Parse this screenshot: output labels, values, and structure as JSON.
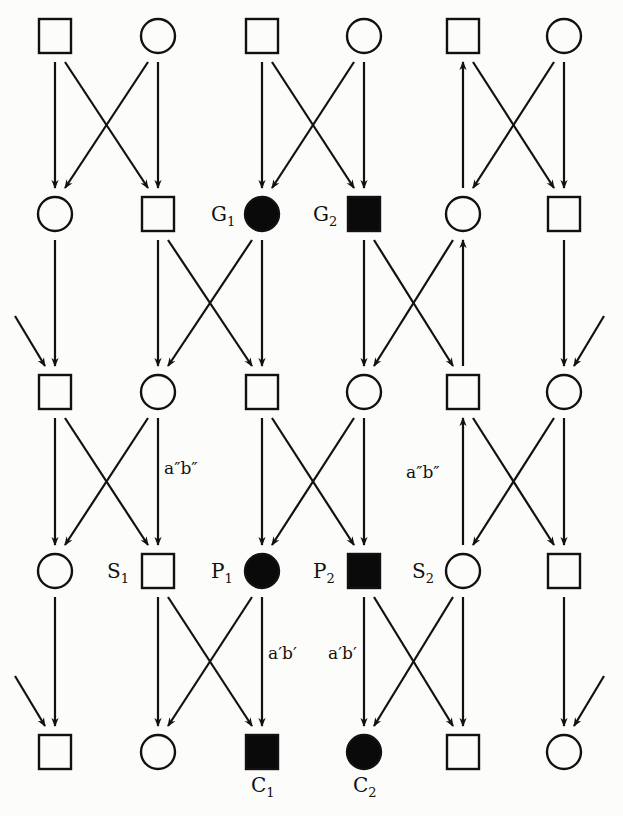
{
  "diagram": {
    "type": "pedigree",
    "columns_x": [
      55,
      158,
      262,
      364,
      463,
      564
    ],
    "rows_y": [
      36,
      214,
      392,
      571,
      752
    ],
    "colors": {
      "line": "#111111",
      "affected_fill": "#0a0a0a",
      "unaffected_fill": "#fcfcfa",
      "background": "#fcfcfa"
    },
    "nodes": [
      {
        "id": "r1c1",
        "row": 0,
        "col": 0,
        "shape": "square",
        "affected": false
      },
      {
        "id": "r1c2",
        "row": 0,
        "col": 1,
        "shape": "circle",
        "affected": false
      },
      {
        "id": "r1c3",
        "row": 0,
        "col": 2,
        "shape": "square",
        "affected": false
      },
      {
        "id": "r1c4",
        "row": 0,
        "col": 3,
        "shape": "circle",
        "affected": false
      },
      {
        "id": "r1c5",
        "row": 0,
        "col": 4,
        "shape": "square",
        "affected": false
      },
      {
        "id": "r1c6",
        "row": 0,
        "col": 5,
        "shape": "circle",
        "affected": false
      },
      {
        "id": "r2c1",
        "row": 1,
        "col": 0,
        "shape": "circle",
        "affected": false
      },
      {
        "id": "r2c2",
        "row": 1,
        "col": 1,
        "shape": "square",
        "affected": false
      },
      {
        "id": "G1",
        "row": 1,
        "col": 2,
        "shape": "circle",
        "affected": true,
        "label": "G",
        "sub": "1"
      },
      {
        "id": "G2",
        "row": 1,
        "col": 3,
        "shape": "square",
        "affected": true,
        "label": "G",
        "sub": "2"
      },
      {
        "id": "r2c5",
        "row": 1,
        "col": 4,
        "shape": "circle",
        "affected": false
      },
      {
        "id": "r2c6",
        "row": 1,
        "col": 5,
        "shape": "square",
        "affected": false
      },
      {
        "id": "r3c1",
        "row": 2,
        "col": 0,
        "shape": "square",
        "affected": false
      },
      {
        "id": "r3c2",
        "row": 2,
        "col": 1,
        "shape": "circle",
        "affected": false
      },
      {
        "id": "r3c3",
        "row": 2,
        "col": 2,
        "shape": "square",
        "affected": false
      },
      {
        "id": "r3c4",
        "row": 2,
        "col": 3,
        "shape": "circle",
        "affected": false
      },
      {
        "id": "r3c5",
        "row": 2,
        "col": 4,
        "shape": "square",
        "affected": false
      },
      {
        "id": "r3c6",
        "row": 2,
        "col": 5,
        "shape": "circle",
        "affected": false
      },
      {
        "id": "r4c1",
        "row": 3,
        "col": 0,
        "shape": "circle",
        "affected": false
      },
      {
        "id": "S1",
        "row": 3,
        "col": 1,
        "shape": "square",
        "affected": false,
        "label": "S",
        "sub": "1"
      },
      {
        "id": "P1",
        "row": 3,
        "col": 2,
        "shape": "circle",
        "affected": true,
        "label": "P",
        "sub": "1"
      },
      {
        "id": "P2",
        "row": 3,
        "col": 3,
        "shape": "square",
        "affected": true,
        "label": "P",
        "sub": "2"
      },
      {
        "id": "S2",
        "row": 3,
        "col": 4,
        "shape": "circle",
        "affected": false,
        "label": "S",
        "sub": "2"
      },
      {
        "id": "r4c6",
        "row": 3,
        "col": 5,
        "shape": "square",
        "affected": false
      },
      {
        "id": "r5c1",
        "row": 4,
        "col": 0,
        "shape": "square",
        "affected": false
      },
      {
        "id": "r5c2",
        "row": 4,
        "col": 1,
        "shape": "circle",
        "affected": false
      },
      {
        "id": "C1",
        "row": 4,
        "col": 2,
        "shape": "square",
        "affected": true,
        "label": "C",
        "sub": "1",
        "label_pos": "below"
      },
      {
        "id": "C2",
        "row": 4,
        "col": 3,
        "shape": "circle",
        "affected": true,
        "label": "C",
        "sub": "2",
        "label_pos": "below"
      },
      {
        "id": "r5c5",
        "row": 4,
        "col": 4,
        "shape": "square",
        "affected": false
      },
      {
        "id": "r5c6",
        "row": 4,
        "col": 5,
        "shape": "circle",
        "affected": false
      }
    ],
    "edges": [
      [
        "r1c1",
        "r2c1"
      ],
      [
        "r1c1",
        "r2c2"
      ],
      [
        "r1c2",
        "r2c1"
      ],
      [
        "r1c2",
        "r2c2"
      ],
      [
        "r1c3",
        "G1"
      ],
      [
        "r1c3",
        "G2"
      ],
      [
        "r1c4",
        "G1"
      ],
      [
        "r1c4",
        "G2"
      ],
      [
        "r2c5",
        "r1c5"
      ],
      [
        "r1c5",
        "r2c6"
      ],
      [
        "r1c6",
        "r2c5"
      ],
      [
        "r1c6",
        "r2c6"
      ],
      [
        "r2c1",
        "r3c1"
      ],
      [
        "r2c2",
        "r3c2"
      ],
      [
        "r2c2",
        "r3c3"
      ],
      [
        "G1",
        "r3c2"
      ],
      [
        "G1",
        "r3c3"
      ],
      [
        "G2",
        "r3c4"
      ],
      [
        "G2",
        "r3c5"
      ],
      [
        "r2c5",
        "r3c4"
      ],
      [
        "r3c5",
        "r2c5"
      ],
      [
        "r2c6",
        "r3c6"
      ],
      [
        "offL",
        "r3c1"
      ],
      [
        "offR",
        "r3c6"
      ],
      [
        "r3c1",
        "r4c1"
      ],
      [
        "r3c1",
        "S1"
      ],
      [
        "r3c2",
        "r4c1"
      ],
      [
        "r3c2",
        "S1"
      ],
      [
        "r3c3",
        "P1"
      ],
      [
        "r3c3",
        "P2"
      ],
      [
        "r3c4",
        "P1"
      ],
      [
        "r3c4",
        "P2"
      ],
      [
        "S2",
        "r3c5"
      ],
      [
        "r3c5",
        "r4c6"
      ],
      [
        "r3c6",
        "S2"
      ],
      [
        "r3c6",
        "r4c6"
      ],
      [
        "r4c1",
        "r5c1"
      ],
      [
        "offL",
        "r5c1"
      ],
      [
        "S1",
        "r5c2"
      ],
      [
        "S1",
        "C1"
      ],
      [
        "P1",
        "r5c2"
      ],
      [
        "P1",
        "C1"
      ],
      [
        "P2",
        "C2"
      ],
      [
        "P2",
        "r5c5"
      ],
      [
        "S2",
        "C2"
      ],
      [
        "S2",
        "r5c5"
      ],
      [
        "r4c6",
        "r5c6"
      ],
      [
        "offR",
        "r5c6"
      ]
    ],
    "annotations": [
      {
        "text": "a″b″",
        "x": 164,
        "y": 470,
        "note": "on S1 incoming line"
      },
      {
        "text": "a″b″",
        "x": 406,
        "y": 474,
        "note": "on S2 upward line"
      },
      {
        "text": "a′b′",
        "x": 268,
        "y": 655,
        "note": "on P1 to C1 line"
      },
      {
        "text": "a′b′",
        "x": 328,
        "y": 655,
        "note": "on P2 to C2 line"
      }
    ]
  }
}
